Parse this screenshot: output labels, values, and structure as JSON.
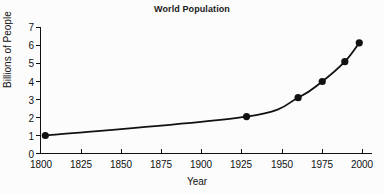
{
  "chart_data": {
    "type": "line",
    "title": "World Population",
    "xlabel": "Year",
    "ylabel": "Billions of People",
    "xlim": [
      1800,
      2000
    ],
    "ylim": [
      0,
      7
    ],
    "xticks": [
      1800,
      1825,
      1850,
      1875,
      1900,
      1925,
      1950,
      1975,
      2000
    ],
    "yticks": [
      0,
      1,
      2,
      3,
      4,
      5,
      6,
      7
    ],
    "grid": false,
    "legend": false,
    "markers": "filled-circle",
    "line_color": "#111111",
    "marker_color": "#111111",
    "x": [
      1803,
      1928,
      1960,
      1975,
      1989,
      1998
    ],
    "values": [
      1.0,
      2.05,
      3.1,
      4.0,
      5.1,
      6.15
    ],
    "series": [
      {
        "name": "World Population",
        "points": [
          {
            "year": 1803,
            "population": 1.0
          },
          {
            "year": 1928,
            "population": 2.05
          },
          {
            "year": 1960,
            "population": 3.1
          },
          {
            "year": 1975,
            "population": 4.0
          },
          {
            "year": 1989,
            "population": 5.1
          },
          {
            "year": 1998,
            "population": 6.15
          }
        ]
      }
    ]
  },
  "axes": {
    "y_tick_labels": [
      "7",
      "6",
      "5",
      "4",
      "3",
      "2",
      "1",
      "0"
    ],
    "x_tick_labels": [
      "1800",
      "1825",
      "1850",
      "1875",
      "1900",
      "1925",
      "1950",
      "1975",
      "2000"
    ]
  }
}
